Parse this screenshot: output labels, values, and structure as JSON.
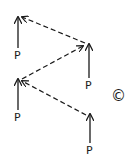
{
  "diagram": {
    "nodes": [
      {
        "id": "p1",
        "label": "P",
        "x": 18,
        "arrow_top": 16,
        "arrow_bottom": 48,
        "label_top": 50
      },
      {
        "id": "p2",
        "label": "P",
        "x": 89,
        "arrow_top": 43,
        "arrow_bottom": 78,
        "label_top": 80
      },
      {
        "id": "p3",
        "label": "P",
        "x": 18,
        "arrow_top": 78,
        "arrow_bottom": 110,
        "label_top": 112
      },
      {
        "id": "p4",
        "label": "P",
        "x": 90,
        "arrow_top": 113,
        "arrow_bottom": 143,
        "label_top": 145
      }
    ],
    "dashed_arrows": [
      {
        "from": "p2",
        "to": "p1"
      },
      {
        "from": "p3",
        "to": "p2"
      },
      {
        "from": "p4",
        "to": "p3"
      }
    ],
    "panel_label": "©",
    "stroke_color": "#1a1a1a"
  }
}
